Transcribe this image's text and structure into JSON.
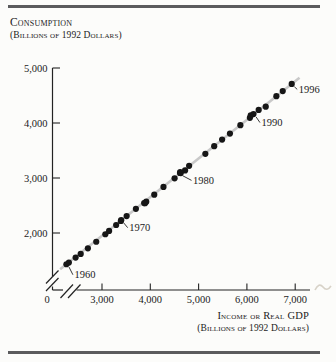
{
  "header": {
    "title_line1": "Consumption",
    "title_line2": "(Billions of 1992 Dollars)"
  },
  "x_axis_title": {
    "line1": "Income or Real GDP",
    "line2": "(Billions of 1992 Dollars)"
  },
  "chart_data": {
    "type": "scatter",
    "xlabel": "Income or Real GDP (Billions of 1992 Dollars)",
    "ylabel": "Consumption (Billions of 1992 Dollars)",
    "x_ticks": [
      3000,
      4000,
      5000,
      6000,
      7000
    ],
    "y_ticks": [
      2000,
      3000,
      4000,
      5000
    ],
    "origin_label": "0",
    "axis_break_x": true,
    "axis_break_y": true,
    "grid": false,
    "legend": false,
    "colors": {
      "dot": "#161616",
      "trend": "#c9c9c9",
      "axis": "#232323"
    },
    "points": [
      {
        "year": 1960,
        "gdp": 2263,
        "consumption": 1432
      },
      {
        "year": 1961,
        "gdp": 2314,
        "consumption": 1462
      },
      {
        "year": 1962,
        "gdp": 2454,
        "consumption": 1553
      },
      {
        "year": 1963,
        "gdp": 2559,
        "consumption": 1620
      },
      {
        "year": 1964,
        "gdp": 2708,
        "consumption": 1722
      },
      {
        "year": 1965,
        "gdp": 2881,
        "consumption": 1841
      },
      {
        "year": 1966,
        "gdp": 3069,
        "consumption": 1977
      },
      {
        "year": 1967,
        "gdp": 3147,
        "consumption": 2037
      },
      {
        "year": 1968,
        "gdp": 3293,
        "consumption": 2145
      },
      {
        "year": 1969,
        "gdp": 3390,
        "consumption": 2218
      },
      {
        "year": 1970,
        "gdp": 3397,
        "consumption": 2233
      },
      {
        "year": 1971,
        "gdp": 3510,
        "consumption": 2308
      },
      {
        "year": 1972,
        "gdp": 3702,
        "consumption": 2439
      },
      {
        "year": 1973,
        "gdp": 3916,
        "consumption": 2570
      },
      {
        "year": 1974,
        "gdp": 3891,
        "consumption": 2542
      },
      {
        "year": 1975,
        "gdp": 3873,
        "consumption": 2544
      },
      {
        "year": 1976,
        "gdp": 4082,
        "consumption": 2697
      },
      {
        "year": 1977,
        "gdp": 4273,
        "consumption": 2837
      },
      {
        "year": 1978,
        "gdp": 4503,
        "consumption": 2994
      },
      {
        "year": 1979,
        "gdp": 4630,
        "consumption": 3089
      },
      {
        "year": 1980,
        "gdp": 4615,
        "consumption": 3093
      },
      {
        "year": 1981,
        "gdp": 4720,
        "consumption": 3137
      },
      {
        "year": 1982,
        "gdp": 4620,
        "consumption": 3106
      },
      {
        "year": 1983,
        "gdp": 4804,
        "consumption": 3222
      },
      {
        "year": 1984,
        "gdp": 5140,
        "consumption": 3439
      },
      {
        "year": 1985,
        "gdp": 5323,
        "consumption": 3578
      },
      {
        "year": 1986,
        "gdp": 5487,
        "consumption": 3699
      },
      {
        "year": 1987,
        "gdp": 5649,
        "consumption": 3808
      },
      {
        "year": 1988,
        "gdp": 5865,
        "consumption": 3961
      },
      {
        "year": 1989,
        "gdp": 6062,
        "consumption": 4095
      },
      {
        "year": 1990,
        "gdp": 6136,
        "consumption": 4162
      },
      {
        "year": 1991,
        "gdp": 6079,
        "consumption": 4137
      },
      {
        "year": 1992,
        "gdp": 6244,
        "consumption": 4238
      },
      {
        "year": 1993,
        "gdp": 6390,
        "consumption": 4296
      },
      {
        "year": 1994,
        "gdp": 6610,
        "consumption": 4487
      },
      {
        "year": 1995,
        "gdp": 6742,
        "consumption": 4580
      },
      {
        "year": 1996,
        "gdp": 6928,
        "consumption": 4711
      }
    ],
    "annotations": [
      {
        "label": "1960",
        "year": 1960,
        "dx": 8,
        "dy": 14
      },
      {
        "label": "1970",
        "year": 1970,
        "dx": 8,
        "dy": 11
      },
      {
        "label": "1980",
        "year": 1980,
        "dx": 13,
        "dy": 11
      },
      {
        "label": "1990",
        "year": 1990,
        "dx": 8,
        "dy": 12
      },
      {
        "label": "1996",
        "year": 1996,
        "dx": 7,
        "dy": 9
      }
    ]
  }
}
